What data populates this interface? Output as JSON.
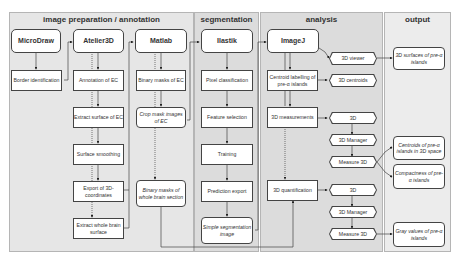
{
  "panels": {
    "image_preparation": "image preparation / annotation",
    "segmentation": "segmentation",
    "analysis": "analysis",
    "output": "output"
  },
  "image_preparation": {
    "microdraw": {
      "tool": "MicroDraw",
      "steps": [
        "Border identification"
      ]
    },
    "atelier3d": {
      "tool": "Atelier3D",
      "steps": [
        "Annotation of EC",
        "Extract surface of EC",
        "Surface smoothing",
        "Export of 3D-coordinates",
        "Extract whole brain surface"
      ]
    },
    "matlab": {
      "tool": "Matlab",
      "steps": [
        "Binary masks of EC",
        "Crop mask images of EC",
        "Binary masks of whole brain section"
      ]
    }
  },
  "segmentation": {
    "ilastik": {
      "tool": "Ilastik",
      "steps": [
        "Pixel classification",
        "Feature selection",
        "Training",
        "Prediction export",
        "Simple segmentation image"
      ]
    }
  },
  "analysis": {
    "imagej": {
      "tool": "ImageJ",
      "steps": [
        "Centroid labelling of pre-α islands",
        "3D measurements",
        "3D quantification"
      ]
    },
    "plugins": [
      "3D viewer",
      "3D centroids",
      "3D",
      "3D Manager",
      "Measure 3D",
      "3D",
      "3D Manager",
      "Measure 3D"
    ]
  },
  "output": {
    "items": [
      "3D surfaces of pre-α islands",
      "Centroids of pre-α islands in 3D space",
      "Compactness of pre-α islands",
      "Gray values of pre-α islands"
    ]
  }
}
